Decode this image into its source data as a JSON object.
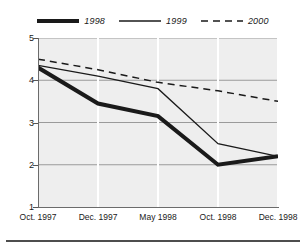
{
  "chart_data": {
    "type": "line",
    "title": "",
    "subtitle": "",
    "xlabel": "",
    "ylabel": "",
    "categories": [
      "Oct. 1997",
      "Dec. 1997",
      "May 1998",
      "Oct. 1998",
      "Dec. 1998"
    ],
    "x_tick_labels": [
      "Oct. 1997",
      "Dec. 1997",
      "May 1998",
      "Oct. 1998",
      "Dec. 1998"
    ],
    "y_tick_labels": [
      "1",
      "2",
      "3",
      "4",
      "5"
    ],
    "y_ticks": [
      1,
      2,
      3,
      4,
      5
    ],
    "ylim": [
      1,
      5
    ],
    "grid": "horizontal-and-vertical",
    "legend_position": "top-center",
    "series": [
      {
        "name": "1998",
        "style": "solid-thick",
        "color": "#1a1a1a",
        "line_width": 4,
        "values": [
          4.3,
          3.45,
          3.15,
          2.0,
          2.2
        ]
      },
      {
        "name": "1999",
        "style": "solid-thin",
        "color": "#1a1a1a",
        "line_width": 1.3,
        "values": [
          4.35,
          4.1,
          3.8,
          2.5,
          2.2
        ]
      },
      {
        "name": "2000",
        "style": "dashed",
        "color": "#1a1a1a",
        "line_width": 1.5,
        "values": [
          4.5,
          4.25,
          3.95,
          3.75,
          3.5
        ]
      }
    ]
  },
  "legend": {
    "items": [
      {
        "label": "1998",
        "swatch": "thick-solid-line-swatch"
      },
      {
        "label": "1999",
        "swatch": "thin-solid-line-swatch"
      },
      {
        "label": "2000",
        "swatch": "dashed-line-swatch"
      }
    ]
  },
  "colors": {
    "plot_background": "#eeeeee",
    "grid_horizontal": "#9a9a9a",
    "grid_vertical": "#ffffff",
    "line": "#1a1a1a",
    "axis": "#6b6b6b",
    "page_background": "#ffffff"
  }
}
